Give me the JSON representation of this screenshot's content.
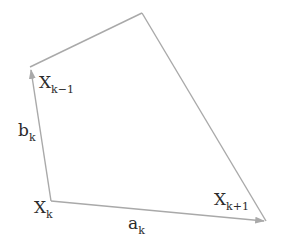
{
  "diagram": {
    "title": "",
    "line_color": "#a9a9a9",
    "text_color": "#2b2b2b",
    "vertices": [
      {
        "id": "Xk",
        "base": "X",
        "sub": "k"
      },
      {
        "id": "Xk-1",
        "base": "X",
        "sub": "k−1"
      },
      {
        "id": "top",
        "base": "",
        "sub": ""
      },
      {
        "id": "Xk+1",
        "base": "X",
        "sub": "k+1"
      }
    ],
    "vectors": [
      {
        "id": "bk",
        "base": "b",
        "sub": "k",
        "from": "Xk",
        "to": "Xk-1"
      },
      {
        "id": "ak",
        "base": "a",
        "sub": "k",
        "from": "Xk",
        "to": "Xk+1"
      }
    ],
    "edges": [
      {
        "from": "Xk-1",
        "to": "top"
      },
      {
        "from": "top",
        "to": "Xk+1"
      }
    ]
  }
}
